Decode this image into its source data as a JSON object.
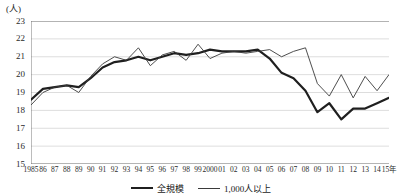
{
  "axis_unit_label": "(人)",
  "chart_data": {
    "type": "line",
    "title": "",
    "subtitle": "",
    "xlabel": "",
    "ylabel": "(人)",
    "ylim": [
      15,
      23
    ],
    "yticks": [
      23,
      22,
      21,
      20,
      19,
      18,
      17,
      16,
      15
    ],
    "grid": true,
    "legend_position": "bottom-center",
    "x": [
      1985,
      1986,
      1987,
      1988,
      1989,
      1990,
      1991,
      1992,
      1993,
      1994,
      1995,
      1996,
      1997,
      1998,
      1999,
      2000,
      2001,
      2002,
      2003,
      2004,
      2005,
      2006,
      2007,
      2008,
      2009,
      2010,
      2011,
      2012,
      2013,
      2014,
      2015
    ],
    "categories": [
      "1985",
      "86",
      "87",
      "88",
      "89",
      "90",
      "91",
      "92",
      "93",
      "94",
      "95",
      "96",
      "97",
      "98",
      "99",
      "2000",
      "01",
      "02",
      "03",
      "04",
      "05",
      "06",
      "07",
      "08",
      "09",
      "10",
      "11",
      "12",
      "13",
      "14",
      "15年"
    ],
    "series": [
      {
        "name": "全規模",
        "style": "thick",
        "color": "#1f1f1f",
        "values": [
          18.6,
          19.2,
          19.3,
          19.4,
          19.3,
          19.8,
          20.4,
          20.7,
          20.8,
          21.0,
          20.8,
          21.0,
          21.2,
          21.1,
          21.2,
          21.4,
          21.3,
          21.3,
          21.3,
          21.4,
          20.9,
          20.1,
          19.8,
          19.1,
          17.9,
          18.4,
          17.5,
          18.1,
          18.1,
          18.4,
          18.7
        ]
      },
      {
        "name": "1,000人以上",
        "style": "thin",
        "color": "#3a3a3a",
        "values": [
          18.3,
          19.0,
          19.3,
          19.4,
          19.0,
          19.9,
          20.6,
          21.0,
          20.8,
          21.5,
          20.5,
          21.1,
          21.3,
          20.8,
          21.7,
          20.9,
          21.2,
          21.3,
          21.2,
          21.3,
          21.4,
          21.0,
          21.3,
          21.5,
          19.5,
          18.8,
          20.0,
          18.7,
          19.9,
          19.1,
          20.0
        ]
      }
    ]
  },
  "legend": [
    {
      "label": "全規模",
      "style": "thick"
    },
    {
      "label": "1,000人以上",
      "style": "thin"
    }
  ]
}
